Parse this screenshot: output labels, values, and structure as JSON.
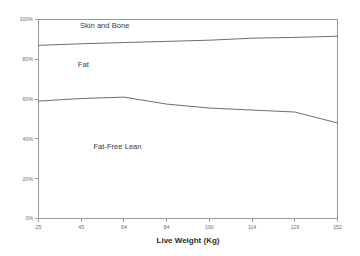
{
  "chart_data": {
    "type": "line",
    "title": "",
    "subtitle": "",
    "xlabel": "Live Weight (Kg)",
    "ylabel": "",
    "categories": [
      "25",
      "45",
      "64",
      "84",
      "100",
      "114",
      "129",
      "152"
    ],
    "x": [
      25,
      45,
      64,
      84,
      100,
      114,
      129,
      152
    ],
    "xlim": [
      25,
      152
    ],
    "ylim": [
      0,
      100
    ],
    "y_ticks": [
      0,
      20,
      40,
      60,
      80,
      100
    ],
    "y_tick_labels": [
      "0%",
      "20%",
      "40%",
      "60%",
      "80%",
      "100%"
    ],
    "x_tick_labels": [
      "25",
      "45",
      "64",
      "84",
      "100",
      "114",
      "129",
      "152"
    ],
    "grid": false,
    "legend_position": "none",
    "series": [
      {
        "name": "Fat-Free Lean boundary",
        "values": [
          59.0,
          60.3,
          61.0,
          57.5,
          55.5,
          54.5,
          53.5,
          48.0
        ]
      },
      {
        "name": "Fat upper boundary",
        "values": [
          87.0,
          87.8,
          88.4,
          89.0,
          89.6,
          90.6,
          91.0,
          91.6
        ]
      }
    ],
    "band_labels": [
      {
        "text": "Skin and Bone",
        "x_index": 1.55,
        "value": 95.5
      },
      {
        "text": "Fat",
        "x_index": 1.05,
        "value": 76.0
      },
      {
        "text": "Fat-Free Lean",
        "x_index": 1.85,
        "value": 35.0
      }
    ],
    "colors": {
      "line": "#6e6e6e",
      "axis": "#9a9a9a",
      "tick_label": "#6b6b6b",
      "band_label": "#3a3a3a",
      "background": "#ffffff"
    }
  }
}
